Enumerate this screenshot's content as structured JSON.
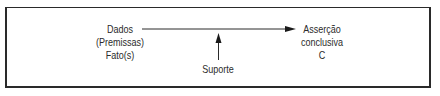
{
  "diagram": {
    "data_node": {
      "lines": [
        "Dados",
        "(Premissas)",
        "Fato(s)"
      ]
    },
    "support_node": {
      "label": "Suporte"
    },
    "conclusion_node": {
      "lines": [
        "Asserção",
        "conclusiva",
        "C"
      ]
    }
  }
}
